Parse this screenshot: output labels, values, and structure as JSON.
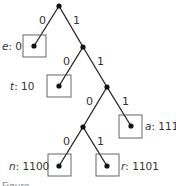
{
  "diagram": {
    "type": "huffman-code-tree",
    "edge_labels": {
      "root_left": "0",
      "root_right": "1",
      "n1_left": "0",
      "n1_right": "1",
      "n2_left": "0",
      "n2_right": "1",
      "n3_left": "0",
      "n3_right": "1"
    },
    "leaves": [
      {
        "symbol": "e",
        "code": ": 0"
      },
      {
        "symbol": "t",
        "code": ": 10"
      },
      {
        "symbol": "a",
        "code": ": 111"
      },
      {
        "symbol": "n",
        "code": ": 1100"
      },
      {
        "symbol": "r",
        "code": ": 1101"
      }
    ],
    "caption": "Figure"
  }
}
